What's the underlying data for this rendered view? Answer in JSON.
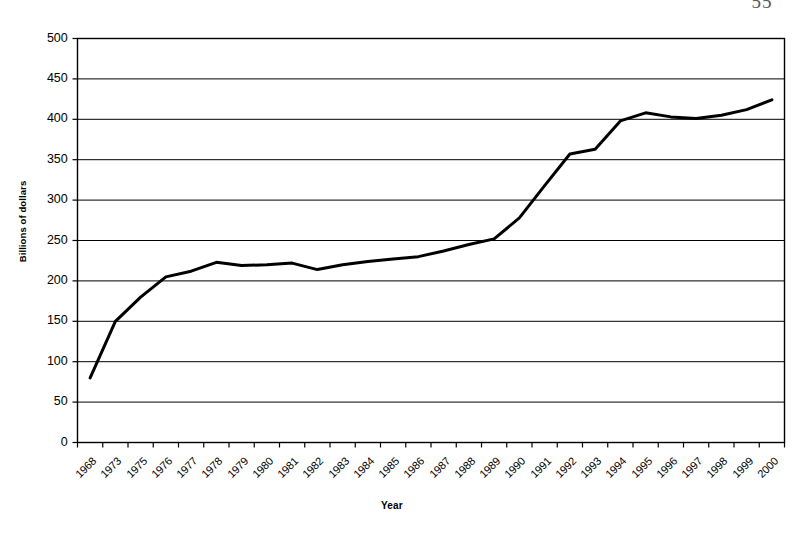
{
  "page": {
    "number": "55"
  },
  "chart_data": {
    "type": "line",
    "title": "",
    "xlabel": "Year",
    "ylabel": "Billions of dollars",
    "ylim": [
      0,
      500
    ],
    "ytick_step": 50,
    "yticks": [
      500,
      450,
      400,
      350,
      300,
      250,
      200,
      150,
      100,
      50,
      0
    ],
    "grid": true,
    "grid_axis": "y",
    "legend": false,
    "legend_position": "none",
    "line_color": "#000000",
    "line_width": 3,
    "plot_background": "#ffffff",
    "border_color": "#000000",
    "categories": [
      "1968",
      "1973",
      "1975",
      "1976",
      "1977",
      "1978",
      "1979",
      "1980",
      "1981",
      "1982",
      "1983",
      "1984",
      "1985",
      "1986",
      "1987",
      "1988",
      "1989",
      "1990",
      "1991",
      "1992",
      "1993",
      "1994",
      "1995",
      "1996",
      "1997",
      "1998",
      "1999",
      "2000"
    ],
    "values": [
      80,
      150,
      180,
      205,
      212,
      223,
      219,
      220,
      222,
      214,
      220,
      224,
      227,
      230,
      237,
      245,
      252,
      278,
      318,
      357,
      363,
      398,
      408,
      403,
      401,
      405,
      412,
      424
    ]
  }
}
